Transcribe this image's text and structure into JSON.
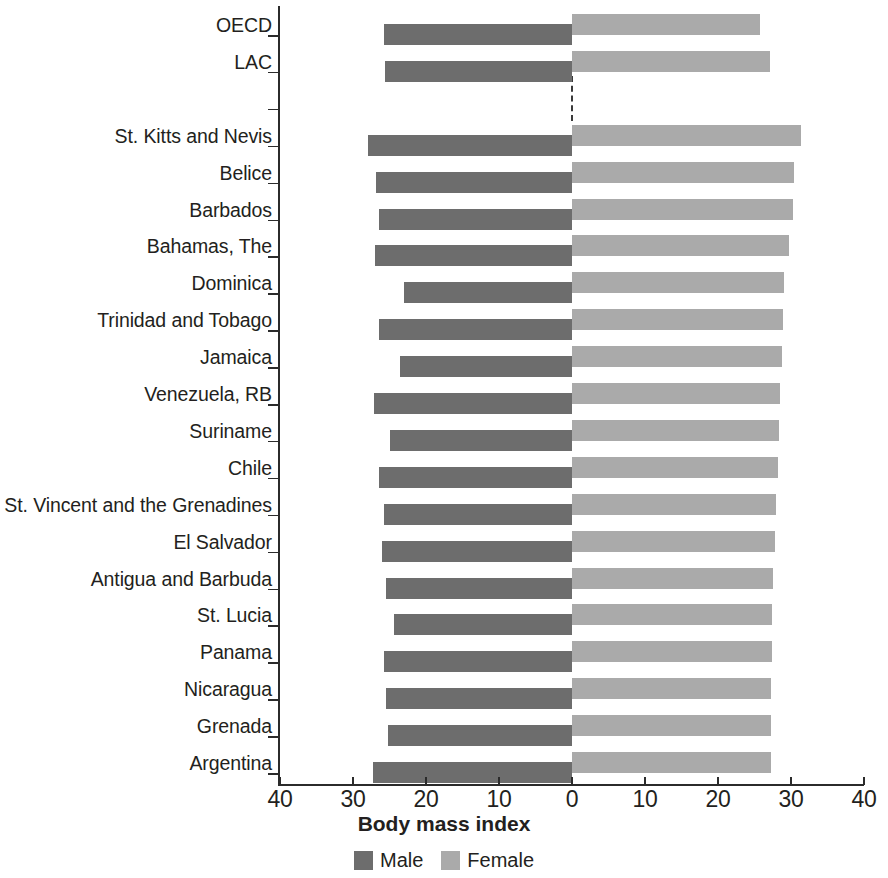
{
  "chart_data": {
    "type": "bar",
    "subtype": "butterfly-diverging-horizontal",
    "title": "",
    "xlabel": "Body mass index",
    "ylabel": "",
    "xlim": [
      -40,
      40
    ],
    "x_tick_labels": [
      "40",
      "30",
      "20",
      "10",
      "0",
      "10",
      "20",
      "30",
      "40"
    ],
    "x_tick_values": [
      -40,
      -30,
      -20,
      -10,
      0,
      10,
      20,
      30,
      40
    ],
    "grid": false,
    "legend_position": "bottom",
    "zero_reference_line": "dashed",
    "categories": [
      "OECD",
      "LAC",
      "",
      "St. Kitts and Nevis",
      "Belice",
      "Barbados",
      "Bahamas, The",
      "Dominica",
      "Trinidad and Tobago",
      "Jamaica",
      "Venezuela, RB",
      "Suriname",
      "Chile",
      "St. Vincent and the Grenadines",
      "El Salvador",
      "Antigua and Barbuda",
      "St. Lucia",
      "Panama",
      "Nicaragua",
      "Grenada",
      "Argentina"
    ],
    "series": [
      {
        "name": "Male",
        "color": "#6d6d6d",
        "side": "left",
        "values": [
          25.7,
          25.6,
          null,
          28.0,
          26.9,
          26.4,
          27.0,
          23.0,
          26.5,
          23.6,
          27.1,
          25.0,
          26.5,
          25.7,
          26.0,
          25.5,
          24.4,
          25.8,
          25.5,
          25.2,
          27.3
        ]
      },
      {
        "name": "Female",
        "color": "#aaaaaa",
        "side": "right",
        "values": [
          25.7,
          27.1,
          null,
          31.4,
          30.4,
          30.3,
          29.7,
          29.1,
          28.9,
          28.8,
          28.5,
          28.3,
          28.2,
          27.9,
          27.8,
          27.6,
          27.4,
          27.4,
          27.3,
          27.2,
          27.2
        ]
      }
    ]
  },
  "legend": {
    "items": [
      {
        "label": "Male",
        "color": "#6d6d6d"
      },
      {
        "label": "Female",
        "color": "#aaaaaa"
      }
    ]
  },
  "colors": {
    "male": "#6d6d6d",
    "female": "#aaaaaa",
    "axis": "#2b2b2b",
    "text": "#231f20",
    "background": "#ffffff"
  }
}
